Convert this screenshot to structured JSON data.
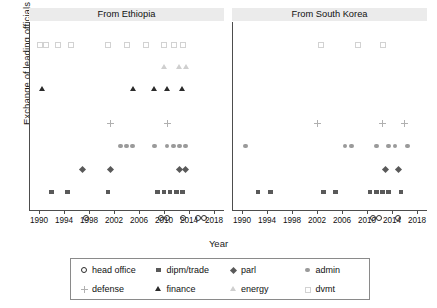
{
  "chart_data": {
    "type": "scatter",
    "title": "",
    "xlabel": "Year",
    "ylabel": "Exchange of leading officials",
    "xlim": [
      1989,
      2019
    ],
    "xticks": [
      1990,
      1994,
      1998,
      2002,
      2006,
      2010,
      2014,
      2018
    ],
    "grid": false,
    "legend_position": "bottom",
    "facets": [
      {
        "label": "From Ethiopia",
        "series": [
          {
            "name": "dvmt",
            "marker": "square-open",
            "color": "#d2d2d2",
            "row": 7,
            "x": [
              1990,
              1991,
              1993,
              1995,
              2001,
              2004,
              2007,
              2010,
              2011.5,
              2013
            ]
          },
          {
            "name": "energy",
            "marker": "triangle-open",
            "color": "#cfcfcf",
            "row": 6,
            "x": [
              2010,
              2012.5,
              2013.5
            ]
          },
          {
            "name": "finance",
            "marker": "triangle-filled",
            "color": "#2b2b2b",
            "row": 5,
            "x": [
              1990.5,
              2005,
              2008.5,
              2010.5,
              2013
            ]
          },
          {
            "name": "defense",
            "marker": "plus",
            "color": "#b0b0b0",
            "row": 4,
            "x": [
              2001.5,
              2010.5
            ]
          },
          {
            "name": "admin",
            "marker": "dot",
            "color": "#9a9a9a",
            "row": 3,
            "x": [
              2003,
              2004,
              2005,
              2008.5,
              2010.5,
              2011.5,
              2012.5,
              2013.5
            ]
          },
          {
            "name": "parl",
            "marker": "diamond",
            "color": "#595959",
            "row": 2,
            "x": [
              1997,
              2001.5,
              2012.5,
              2013.5
            ]
          },
          {
            "name": "dipm/trade",
            "marker": "square-filled",
            "color": "#595959",
            "row": 1,
            "x": [
              1992,
              1994.5,
              2001,
              2009,
              2010,
              2011,
              2012,
              2013
            ]
          },
          {
            "name": "head office",
            "marker": "circle",
            "color": "#2b2b2b",
            "row": 0,
            "x": [
              1997.5,
              2009.5,
              2010.5,
              2013,
              2015.5,
              2016.5
            ]
          }
        ]
      },
      {
        "label": "From South Korea",
        "series": [
          {
            "name": "dvmt",
            "marker": "square-open",
            "color": "#d2d2d2",
            "row": 7,
            "x": [
              2002.5,
              2008.5,
              2012.5
            ]
          },
          {
            "name": "energy",
            "marker": "triangle-open",
            "color": "#cfcfcf",
            "row": 6,
            "x": []
          },
          {
            "name": "finance",
            "marker": "triangle-filled",
            "color": "#2b2b2b",
            "row": 5,
            "x": []
          },
          {
            "name": "defense",
            "marker": "plus",
            "color": "#b0b0b0",
            "row": 4,
            "x": [
              2002,
              2012.5,
              2016
            ]
          },
          {
            "name": "admin",
            "marker": "dot",
            "color": "#9a9a9a",
            "row": 3,
            "x": [
              1990.5,
              2006.5,
              2007.5,
              2011.5,
              2013.5,
              2014.5,
              2016.5
            ]
          },
          {
            "name": "parl",
            "marker": "diamond",
            "color": "#595959",
            "row": 2,
            "x": [
              2013,
              2015
            ]
          },
          {
            "name": "dipm/trade",
            "marker": "square-filled",
            "color": "#595959",
            "row": 1,
            "x": [
              1992.5,
              1994.5,
              2003,
              2005,
              2010.5,
              2011.5,
              2012.5,
              2013.5,
              2015.5
            ]
          },
          {
            "name": "head office",
            "marker": "circle",
            "color": "#2b2b2b",
            "row": 0,
            "x": [
              2011,
              2012,
              2015
            ]
          }
        ]
      }
    ]
  },
  "axis": {
    "ylabel": "Exchange of leading officials",
    "xlabel": "Year",
    "xtick_labels": [
      "1990",
      "1994",
      "1998",
      "2002",
      "2006",
      "2010",
      "2014",
      "2018"
    ]
  },
  "panels": {
    "left_title": "From Ethiopia",
    "right_title": "From South Korea"
  },
  "legend": {
    "rows": [
      [
        {
          "label": "head office",
          "marker": "circle"
        },
        {
          "label": "dipm/trade",
          "marker": "square-filled"
        },
        {
          "label": "parl",
          "marker": "diamond"
        },
        {
          "label": "admin",
          "marker": "dot"
        }
      ],
      [
        {
          "label": "defense",
          "marker": "plus"
        },
        {
          "label": "finance",
          "marker": "triangle-filled"
        },
        {
          "label": "energy",
          "marker": "triangle-open"
        },
        {
          "label": "dvmt",
          "marker": "square-open"
        }
      ]
    ]
  },
  "colors": {
    "strip_bg": "#ebebeb",
    "axis": "#4d4d4d",
    "dark_marker": "#2b2b2b",
    "mid_marker": "#595959",
    "light_marker": "#9a9a9a",
    "faint_marker": "#d2d2d2"
  }
}
